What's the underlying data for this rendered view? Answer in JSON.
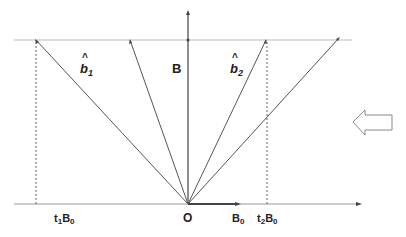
{
  "diagram": {
    "labels": {
      "b1": "b",
      "b1_sub": "1",
      "b2": "b",
      "b2_sub": "2",
      "hat": "^",
      "B": "B",
      "origin": "O",
      "B0": "B",
      "B0_sub": "0",
      "t1B0_t": "t",
      "t1B0_tsub": "1",
      "t1B0_B": "B",
      "t1B0_Bsub": "0",
      "t2B0_t": "t",
      "t2B0_tsub": "2",
      "t2B0_B": "B",
      "t2B0_Bsub": "0"
    },
    "colors": {
      "line": "#444444",
      "guide": "#bbbbbb",
      "arrow_outline": "#888888"
    }
  }
}
